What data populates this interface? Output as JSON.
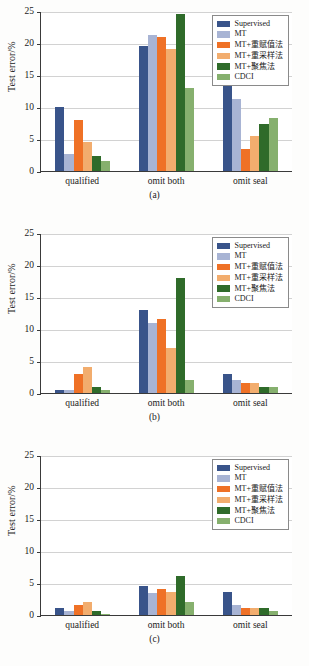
{
  "figure": {
    "ylabel": "Test error/%",
    "ytick_labels": [
      "0",
      "5",
      "10",
      "15",
      "20",
      "25"
    ],
    "series_names": [
      "Supervised",
      "MT",
      "MT+重赋值法",
      "MT+重采样法",
      "MT+聚焦法",
      "CDCI"
    ],
    "series_colors": [
      "#39548a",
      "#a8b4d4",
      "#ef7126",
      "#f2ad6e",
      "#2f6b2a",
      "#86b06e"
    ],
    "categories": [
      "qualified",
      "omit both",
      "omit seal"
    ],
    "captions": [
      "(a)",
      "(b)",
      "(c)"
    ]
  },
  "chart_data": [
    {
      "type": "bar",
      "title": "(a)",
      "xlabel": "",
      "ylabel": "Test error/%",
      "ylim": [
        0,
        25
      ],
      "yticks": [
        0,
        5,
        10,
        15,
        20,
        25
      ],
      "grid": true,
      "legend_position": "upper right",
      "categories": [
        "qualified",
        "omit both",
        "omit seal"
      ],
      "series": [
        {
          "name": "Supervised",
          "color": "#39548a",
          "values": [
            10.0,
            19.5,
            14.5
          ]
        },
        {
          "name": "MT",
          "color": "#a8b4d4",
          "values": [
            2.6,
            21.3,
            11.3
          ]
        },
        {
          "name": "MT+重赋值法",
          "color": "#ef7126",
          "values": [
            7.9,
            21.0,
            3.4
          ]
        },
        {
          "name": "MT+重采样法",
          "color": "#f2ad6e",
          "values": [
            4.5,
            19.0,
            5.4
          ]
        },
        {
          "name": "MT+聚焦法",
          "color": "#2f6b2a",
          "values": [
            2.3,
            24.6,
            7.4
          ]
        },
        {
          "name": "CDCI",
          "color": "#86b06e",
          "values": [
            1.6,
            12.9,
            8.3
          ]
        }
      ]
    },
    {
      "type": "bar",
      "title": "(b)",
      "xlabel": "",
      "ylabel": "Test error/%",
      "ylim": [
        0,
        25
      ],
      "yticks": [
        0,
        5,
        10,
        15,
        20,
        25
      ],
      "grid": true,
      "legend_position": "upper right",
      "categories": [
        "qualified",
        "omit both",
        "omit seal"
      ],
      "series": [
        {
          "name": "Supervised",
          "color": "#39548a",
          "values": [
            0.5,
            13.0,
            3.0
          ]
        },
        {
          "name": "MT",
          "color": "#a8b4d4",
          "values": [
            0.5,
            11.0,
            2.0
          ]
        },
        {
          "name": "MT+重赋值法",
          "color": "#ef7126",
          "values": [
            3.0,
            11.5,
            1.6
          ]
        },
        {
          "name": "MT+重采样法",
          "color": "#f2ad6e",
          "values": [
            4.0,
            7.1,
            1.5
          ]
        },
        {
          "name": "MT+聚焦法",
          "color": "#2f6b2a",
          "values": [
            1.0,
            18.0,
            1.0
          ]
        },
        {
          "name": "CDCI",
          "color": "#86b06e",
          "values": [
            0.5,
            2.0,
            1.0
          ]
        }
      ]
    },
    {
      "type": "bar",
      "title": "(c)",
      "xlabel": "",
      "ylabel": "Test error/%",
      "ylim": [
        0,
        25
      ],
      "yticks": [
        0,
        5,
        10,
        15,
        20,
        25
      ],
      "grid": true,
      "legend_position": "upper right",
      "categories": [
        "qualified",
        "omit both",
        "omit seal"
      ],
      "series": [
        {
          "name": "Supervised",
          "color": "#39548a",
          "values": [
            1.1,
            4.6,
            3.6
          ]
        },
        {
          "name": "MT",
          "color": "#a8b4d4",
          "values": [
            0.6,
            3.5,
            1.6
          ]
        },
        {
          "name": "MT+重赋值法",
          "color": "#ef7126",
          "values": [
            1.6,
            4.1,
            1.1
          ]
        },
        {
          "name": "MT+重采样法",
          "color": "#f2ad6e",
          "values": [
            2.1,
            3.6,
            1.1
          ]
        },
        {
          "name": "MT+聚焦法",
          "color": "#2f6b2a",
          "values": [
            0.6,
            6.1,
            1.1
          ]
        },
        {
          "name": "CDCI",
          "color": "#86b06e",
          "values": [
            0.1,
            2.1,
            0.6
          ]
        }
      ]
    }
  ]
}
